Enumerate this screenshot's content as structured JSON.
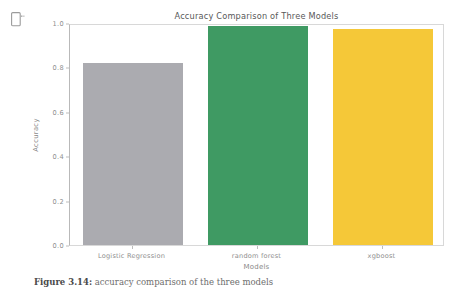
{
  "cell": {
    "output_marker_icon": "output-cell-icon"
  },
  "chart_data": {
    "type": "bar",
    "title": "Accuracy Comparison of Three Models",
    "xlabel": "Models",
    "ylabel": "Accuracy",
    "categories": [
      "Logistic Regression",
      "random forest",
      "xgboost"
    ],
    "values": [
      0.82,
      0.985,
      0.975
    ],
    "ylim": [
      0.0,
      1.0
    ],
    "yticks": [
      "0.0",
      "0.2",
      "0.4",
      "0.6",
      "0.8",
      "1.0"
    ],
    "ytick_values": [
      0.0,
      0.2,
      0.4,
      0.6,
      0.8,
      1.0
    ],
    "colors": [
      "#ABABB0",
      "#3F9A63",
      "#F5C838"
    ],
    "grid": false,
    "legend": null
  },
  "caption": {
    "label": "Figure 3.14:",
    "text": " accuracy comparison of the three models"
  }
}
